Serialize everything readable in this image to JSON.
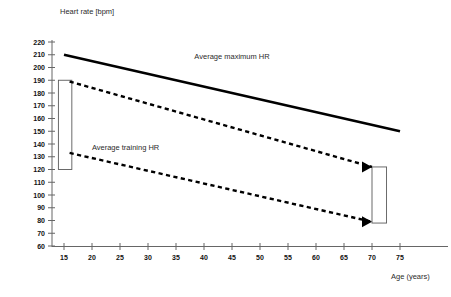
{
  "chart_data": {
    "type": "line",
    "title": "",
    "ylabel": "Heart rate [bpm]",
    "xlabel": "Age (years)",
    "xlim": [
      12,
      78
    ],
    "ylim": [
      60,
      220
    ],
    "grid": false,
    "legend_position": "inline-annotations",
    "x_ticks": [
      15,
      20,
      25,
      30,
      35,
      40,
      45,
      50,
      55,
      60,
      65,
      70,
      75
    ],
    "y_ticks": [
      60,
      70,
      80,
      90,
      100,
      110,
      120,
      130,
      140,
      150,
      160,
      170,
      180,
      190,
      200,
      210,
      220
    ],
    "series": [
      {
        "name": "Average maximum HR",
        "style": "solid",
        "x": [
          15,
          75
        ],
        "values": [
          210,
          150
        ],
        "label_x": 45,
        "label_y": 206
      },
      {
        "name": "Average training HR upper bound",
        "style": "dashed",
        "x": [
          16,
          70
        ],
        "values": [
          189,
          122
        ]
      },
      {
        "name": "Average training HR lower bound",
        "style": "dashed",
        "x": [
          16,
          70
        ],
        "values": [
          133,
          79
        ]
      }
    ],
    "annotations": [
      {
        "text": "Average maximum HR",
        "x": 45,
        "y": 207
      },
      {
        "text": "Average training HR",
        "x": 26,
        "y": 135
      }
    ],
    "brackets": [
      {
        "name": "training-zone-young",
        "x0": 14,
        "x1": 16.4,
        "y0": 120,
        "y1": 190
      },
      {
        "name": "training-zone-old",
        "x0": 70,
        "x1": 72.6,
        "y0": 78,
        "y1": 122
      }
    ],
    "arrows": [
      {
        "name": "arrow-upper-training-bound",
        "x": 70,
        "y": 122
      },
      {
        "name": "arrow-lower-training-bound",
        "x": 70,
        "y": 79
      }
    ],
    "colors": {
      "series": "#000000",
      "axis": "#666666",
      "bracket": "#5a5a5a",
      "text": "#1a1a1a",
      "background": "#ffffff"
    }
  }
}
